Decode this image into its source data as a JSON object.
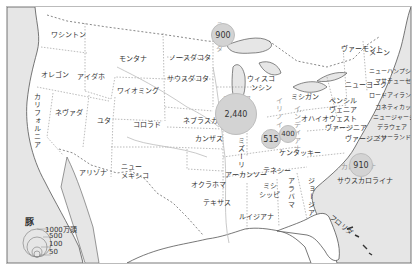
{
  "map": {
    "title": "豚",
    "states": {
      "washington": "ワシントン",
      "oregon": "オレゴン",
      "california": "カリフォルニア",
      "idaho": "アイダホ",
      "nevada": "ネヴァダ",
      "montana": "モンタナ",
      "wyoming": "ワイオミング",
      "utah": "ユタ",
      "colorado": "コロラド",
      "arizona": "アリゾナ",
      "new_mexico_1": "ニュー",
      "new_mexico_2": "メキシコ",
      "north_dakota": "ノースダコタ",
      "south_dakota": "サウスダコタ",
      "nebraska": "ネブラスカ",
      "kansas": "カンザス",
      "oklahoma": "オクラホマ",
      "texas": "テキサス",
      "minnesota": "ミネソタ",
      "iowa": "アイオワ",
      "missouri": "ミズーリ",
      "arkansas": "アーカンソー",
      "louisiana": "ルイジアナ",
      "wisconsin_1": "ウィスコ",
      "wisconsin_2": "ンシン",
      "illinois": "イリノイ",
      "michigan": "ミシガン",
      "indiana": "インディアナ",
      "ohio": "オハイオ",
      "kentucky": "ケンタッキー",
      "tennessee": "テネシー",
      "mississippi_1": "ミシ",
      "mississippi_2": "シッピ",
      "alabama": "アラバマ",
      "georgia": "ジョージア",
      "florida": "フロリダ",
      "south_carolina": "サウスカロライナ",
      "north_carolina": "カロライナ",
      "virginia": "ヴァージニア",
      "west_virginia_1": "ウェスト",
      "west_virginia_2": "ヴァージニア",
      "pennsylvania_1": "ペンシル",
      "pennsylvania_2": "ヴェニア",
      "new_york": "ニューヨーク",
      "vermont": "ヴァーモント",
      "maine": "メーン",
      "new_hampshire": "ニューハンプシャー",
      "massachusetts": "マサチューセッツ",
      "rhode_island": "ロードアイランド",
      "connecticut": "コネティカット",
      "new_jersey": "ニュージャージー",
      "delaware": "デラウェア",
      "maryland": "メリーランド"
    },
    "bubbles": [
      {
        "state": "minnesota",
        "value": "900"
      },
      {
        "state": "iowa",
        "value": "2,440"
      },
      {
        "state": "illinois",
        "value": "515"
      },
      {
        "state": "indiana",
        "value": "400"
      },
      {
        "state": "north_carolina",
        "value": "910"
      }
    ],
    "legend": {
      "title": "豚",
      "items": [
        "1000万頭",
        "500",
        "100",
        "50"
      ]
    },
    "colors": {
      "bubble_fill": "#d3d3d3",
      "water": "#e6e6e6",
      "border": "#555555"
    }
  }
}
